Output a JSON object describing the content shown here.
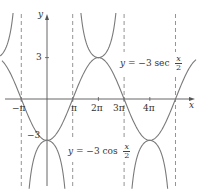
{
  "chart_data": {
    "type": "line",
    "title": "",
    "xlabel": "x",
    "ylabel": "y",
    "x_ticks": [
      "-π",
      "π",
      "2π",
      "3π",
      "4π"
    ],
    "x_tick_values": [
      -3.14159,
      3.14159,
      6.28319,
      9.42478,
      12.56637
    ],
    "y_ticks": [
      "3",
      "-3"
    ],
    "y_tick_values": [
      3,
      -3
    ],
    "xlim": [
      -5.8,
      17.2
    ],
    "ylim": [
      -6.5,
      7.2
    ],
    "grid": false,
    "asymptotes_x": [
      -3.14159,
      3.14159,
      9.42478,
      15.70796
    ],
    "series": [
      {
        "name": "y = -3 sec x/2",
        "function": "-3/cos(x/2)",
        "style": "solid",
        "color": "#777777"
      },
      {
        "name": "y = -3 cos x/2",
        "function": "-3*cos(x/2)",
        "style": "solid",
        "color": "#777777"
      }
    ],
    "annotations": [
      {
        "text": "y = -3 sec x/2",
        "near": [
          2.6,
          3
        ]
      },
      {
        "text": "y = -3 cos x/2",
        "near": [
          0.9,
          -3
        ]
      }
    ]
  },
  "labels": {
    "y_axis": "y",
    "x_axis": "x",
    "tick_3": "3",
    "tick_neg3": "−3",
    "tick_negpi": "−π",
    "tick_pi": "π",
    "tick_2pi": "2π",
    "tick_3pi": "3π",
    "tick_4pi": "4π"
  },
  "equations": {
    "sec": {
      "lhs": "y",
      "mid": " = −3 sec ",
      "num": "x",
      "den": "2"
    },
    "cos": {
      "lhs": "y",
      "mid": " = −3 cos ",
      "num": "x",
      "den": "2"
    }
  }
}
